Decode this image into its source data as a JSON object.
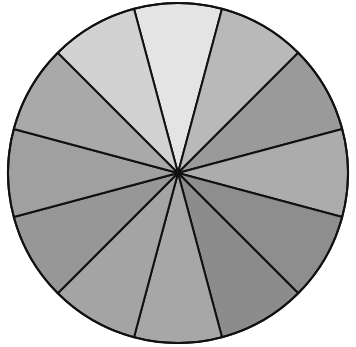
{
  "diagram": {
    "type": "divided-circle",
    "center": [
      178,
      173
    ],
    "radius": 170,
    "segment_count": 12,
    "start_angle_deg": -15,
    "stroke_color": "#111111",
    "stroke_width": 2,
    "segments": [
      {
        "index": 1,
        "fill": "#e4e4e4"
      },
      {
        "index": 2,
        "fill": "#b9b9b9"
      },
      {
        "index": 3,
        "fill": "#9a9a9a"
      },
      {
        "index": 4,
        "fill": "#acacac"
      },
      {
        "index": 5,
        "fill": "#8e8e8e"
      },
      {
        "index": 6,
        "fill": "#8c8c8c"
      },
      {
        "index": 7,
        "fill": "#a7a7a7"
      },
      {
        "index": 8,
        "fill": "#a4a4a4"
      },
      {
        "index": 9,
        "fill": "#979797"
      },
      {
        "index": 10,
        "fill": "#a0a0a0"
      },
      {
        "index": 11,
        "fill": "#a9a9a9"
      },
      {
        "index": 12,
        "fill": "#d2d2d2"
      }
    ]
  }
}
